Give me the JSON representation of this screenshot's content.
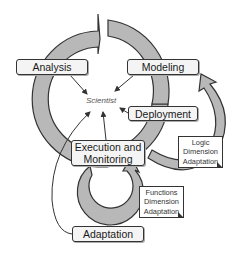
{
  "diagram": {
    "center_label": "Scientist",
    "phases": [
      {
        "id": "analysis",
        "label": "Analysis"
      },
      {
        "id": "modeling",
        "label": "Modeling"
      },
      {
        "id": "deployment",
        "label": "Deployment"
      },
      {
        "id": "execution",
        "label_line1": "Execution and",
        "label_line2": "Monitoring"
      },
      {
        "id": "adaptation",
        "label": "Adaptation"
      }
    ],
    "notes": [
      {
        "id": "logic",
        "lines": [
          "Logic",
          "Dimension",
          "Adaptation"
        ]
      },
      {
        "id": "functions",
        "lines": [
          "Functions",
          "Dimension",
          "Adaptation"
        ]
      }
    ],
    "colors": {
      "cycle_fill": "#b8b8b8",
      "stroke": "#333333",
      "box_fill": "#f4f4f4"
    }
  }
}
